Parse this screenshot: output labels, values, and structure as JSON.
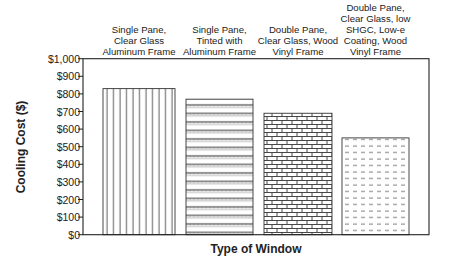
{
  "chart_data": {
    "type": "bar",
    "title": "",
    "xlabel": "Type of Window",
    "ylabel": "Cooling Cost ($)",
    "ylim": [
      0,
      1000
    ],
    "yticks": [
      0,
      100,
      200,
      300,
      400,
      500,
      600,
      700,
      800,
      900,
      1000
    ],
    "ytick_labels": [
      "$0",
      "$100",
      "$200",
      "$300",
      "$400",
      "$500",
      "$600",
      "$700",
      "$800",
      "$900",
      "$1,000"
    ],
    "grid": false,
    "legend": "none",
    "categories": [
      "Single Pane, Clear Glass Aluminum Frame",
      "Single Pane, Tinted with Aluminum Frame",
      "Double Pane, Clear Glass, Wood Vinyl Frame",
      "Double Pane, Clear Glass, low SHGC, Low-e Coating, Wood Vinyl Frame"
    ],
    "category_label_lines": [
      [
        "Single Pane,",
        "Clear Glass",
        "Aluminum Frame"
      ],
      [
        "Single Pane,",
        "Tinted with",
        "Aluminum Frame"
      ],
      [
        "Double Pane,",
        "Clear Glass, Wood",
        "Vinyl Frame"
      ],
      [
        "Double Pane,",
        "Clear Glass, low",
        "SHGC, Low-e",
        "Coating, Wood",
        "Vinyl Frame"
      ]
    ],
    "category_label_position": "top",
    "values": [
      830,
      770,
      690,
      550
    ],
    "patterns": [
      "vertical-lines",
      "wavy-hatch",
      "brick",
      "dashed-horizontal"
    ],
    "colors": {
      "bar_fill": "#ffffff",
      "pattern": "#333333",
      "axis": "#222222"
    }
  }
}
